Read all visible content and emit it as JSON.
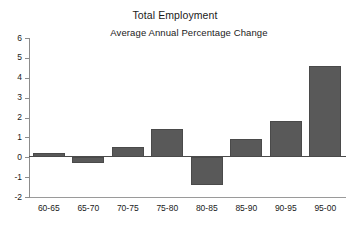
{
  "chart_data": {
    "type": "bar",
    "title": "Total Employment",
    "subtitle": "Average Annual Percentage Change",
    "xlabel": "",
    "ylabel": "",
    "categories": [
      "60-65",
      "65-70",
      "70-75",
      "75-80",
      "80-85",
      "85-90",
      "90-95",
      "95-00"
    ],
    "values": [
      0.2,
      -0.3,
      0.5,
      1.4,
      -1.4,
      0.9,
      1.8,
      4.6
    ],
    "ylim": [
      -2,
      6
    ],
    "ytick_labels": [
      "6",
      "5",
      "4",
      "3",
      "2",
      "1",
      "0",
      "-1",
      "-2"
    ],
    "ytick_values": [
      6,
      5,
      4,
      3,
      2,
      1,
      0,
      -1,
      -2
    ],
    "grid": false,
    "legend": false,
    "bar_color": "#595959",
    "axis_color": "#8c8c8c",
    "zero_line_color": "#4a4a4a",
    "text_color": "#1a1a1a"
  }
}
